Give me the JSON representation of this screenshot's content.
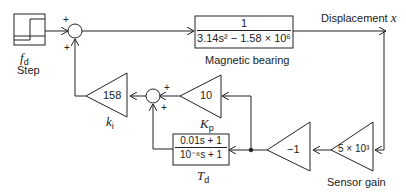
{
  "diagram": {
    "step": {
      "label": "Step",
      "symbol": "f",
      "symbol_sub": "d"
    },
    "summer_main": {
      "signs": [
        "+",
        "+"
      ]
    },
    "plant": {
      "numerator": "1",
      "denominator": "3.14s² − 1.58 × 10⁶",
      "label": "Magnetic bearing"
    },
    "output": {
      "label": "Displacement",
      "symbol": "x"
    },
    "sensor": {
      "gain": "5 × 10³",
      "label": "Sensor gain"
    },
    "inverter": {
      "gain": "−1"
    },
    "kp": {
      "gain": "10",
      "symbol": "K",
      "symbol_sub": "p"
    },
    "td": {
      "numerator": "0.01s + 1",
      "denominator": "10⁻⁶s + 1",
      "symbol": "T",
      "symbol_sub": "d"
    },
    "summer_inner": {
      "signs": [
        "+",
        "+"
      ]
    },
    "ki": {
      "gain": "158",
      "symbol": "k",
      "symbol_sub": "i"
    }
  }
}
